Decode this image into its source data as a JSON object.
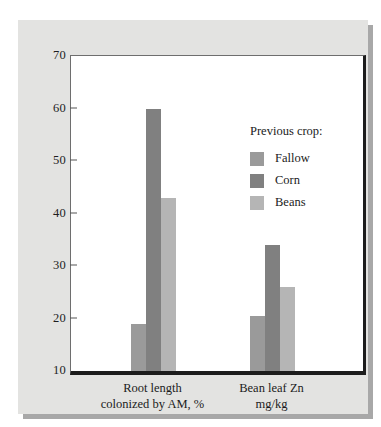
{
  "chart_data": {
    "type": "bar",
    "title": "",
    "xlabel": "",
    "ylabel": "",
    "ylim": [
      10,
      70
    ],
    "yticks": [
      10,
      20,
      30,
      40,
      50,
      60,
      70
    ],
    "ytick_labels": [
      "10",
      "20",
      "30",
      "40",
      "50",
      "60",
      "70"
    ],
    "grid": false,
    "legend_position": "inside-upper-right",
    "legend_title": "Previous crop:",
    "categories": [
      "Root length\ncolonized by AM, %",
      "Bean leaf Zn\nmg/kg"
    ],
    "series": [
      {
        "name": "Fallow",
        "values": [
          19,
          20.5
        ],
        "color": "#9a9a9a"
      },
      {
        "name": "Corn",
        "values": [
          60,
          34
        ],
        "color": "#808080"
      },
      {
        "name": "Beans",
        "values": [
          43,
          26
        ],
        "color": "#b5b5b5"
      }
    ]
  },
  "axis": {
    "y_tick_labels": [
      "70",
      "60",
      "50",
      "40",
      "30",
      "20",
      "10"
    ],
    "group_labels": [
      "Root length\ncolonized by AM, %",
      "Bean leaf Zn\nmg/kg"
    ]
  },
  "legend": {
    "title": "Previous crop:",
    "entries": [
      {
        "label": "Fallow",
        "color": "#9a9a9a"
      },
      {
        "label": "Corn",
        "color": "#808080"
      },
      {
        "label": "Beans",
        "color": "#b5b5b5"
      }
    ]
  },
  "colors": {
    "panel_background": "#e3e3e1",
    "panel_shadow": "#a8a8a8",
    "plot_background": "#ffffff",
    "axis_line": "#1c1c1c",
    "text": "#1b1b1b"
  }
}
